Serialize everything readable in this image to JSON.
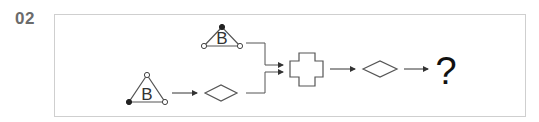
{
  "problem": {
    "number": "02"
  },
  "diagram": {
    "top_triangle": {
      "letter": "B",
      "apex_dot": "filled",
      "base_left_dot": "open",
      "base_right_dot": "open"
    },
    "bottom_triangle": {
      "letter": "B",
      "apex_dot": "open",
      "base_left_dot": "filled",
      "base_right_dot": "open"
    },
    "shapes": [
      "triangle-B",
      "diamond",
      "cross",
      "diamond"
    ],
    "answer_placeholder": "?"
  },
  "colors": {
    "stroke": "#555555",
    "frame_border": "#cfcfcf",
    "label": "#6b6b6b"
  }
}
